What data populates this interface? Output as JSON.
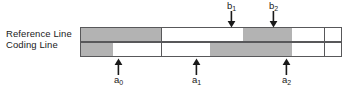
{
  "figure": {
    "background_color": "#ffffff",
    "line_color": "#58585a",
    "shade_color": "#b3b3b3"
  },
  "row_labels": {
    "reference": "Reference Line",
    "coding": "Coding Line"
  },
  "grid": {
    "cell_count": 16,
    "cell_width": 16.3,
    "row_height": 15,
    "left": 80,
    "top": 27,
    "reference_line": {
      "name": "Reference Line",
      "cells": [
        "shaded",
        "shaded",
        "shaded",
        "shaded",
        "shaded",
        "white",
        "white",
        "white",
        "white",
        "white",
        "shaded",
        "shaded",
        "shaded",
        "white",
        "white",
        "white"
      ]
    },
    "coding_line": {
      "name": "Coding Line",
      "cells": [
        "shaded",
        "shaded",
        "white",
        "white",
        "white",
        "white",
        "white",
        "white",
        "shaded",
        "shaded",
        "shaded",
        "shaded",
        "shaded",
        "white",
        "white",
        "white"
      ]
    }
  },
  "annotations": {
    "below": [
      {
        "id": "a0",
        "label": "a",
        "subscript": "0",
        "x": 118,
        "direction": "up"
      },
      {
        "id": "a1",
        "label": "a",
        "subscript": "1",
        "x": 196,
        "direction": "up"
      },
      {
        "id": "a2",
        "label": "a",
        "subscript": "2",
        "x": 286,
        "direction": "up"
      }
    ],
    "above": [
      {
        "id": "b1",
        "label": "b",
        "subscript": "1",
        "x": 231,
        "direction": "down"
      },
      {
        "id": "b2",
        "label": "b",
        "subscript": "2",
        "x": 273,
        "direction": "down"
      }
    ]
  }
}
